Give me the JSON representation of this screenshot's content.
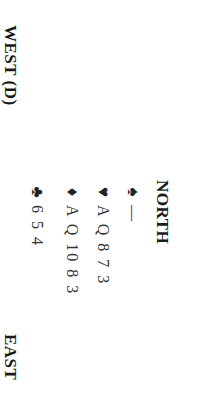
{
  "deal": {
    "north": {
      "label": "NORTH",
      "hand": [
        {
          "suit": "spades",
          "symbol": "♠",
          "cards": "—"
        },
        {
          "suit": "hearts",
          "symbol": "♥",
          "cards": "A Q 8 7 3"
        },
        {
          "suit": "diamonds",
          "symbol": "♦",
          "cards": "A Q 10 8 3"
        },
        {
          "suit": "clubs",
          "symbol": "♣",
          "cards": "6 5 4"
        }
      ]
    },
    "west": {
      "label": "WEST (D)"
    },
    "east": {
      "label": "EAST"
    }
  },
  "orientation": "rotated 90° clockwise",
  "colors": {
    "text": "#1a1a1a",
    "background": "#ffffff"
  }
}
